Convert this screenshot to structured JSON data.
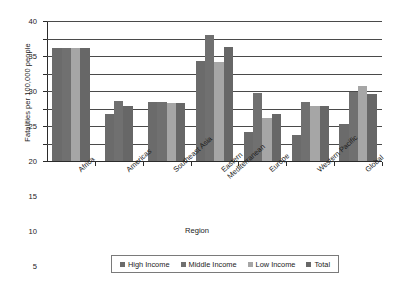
{
  "chart_data": {
    "type": "bar",
    "title": "",
    "xlabel": "Region",
    "ylabel": "Fatalities per 100,000 people",
    "ylim": [
      0,
      40
    ],
    "ytick_step": 5,
    "yticks": [
      "40",
      "35",
      "30",
      "25",
      "20",
      "15",
      "10",
      "5",
      "0"
    ],
    "grid": true,
    "legend_position": "bottom",
    "categories": [
      "Africa",
      "Americas",
      "Southeast Asia",
      "Eastern\nMediterranean",
      "Europe",
      "Western Pacific",
      "Global"
    ],
    "series": [
      {
        "name": "High Income",
        "color": "#6b6b6b",
        "values": [
          32.2,
          13.5,
          16.9,
          28.5,
          8.2,
          7.3,
          10.5
        ]
      },
      {
        "name": "Middle Income",
        "color": "#707070",
        "values": [
          32.3,
          17.2,
          16.8,
          36.0,
          19.5,
          16.9,
          19.6
        ]
      },
      {
        "name": "Low Income",
        "color": "#a6a6a6",
        "values": [
          32.3,
          null,
          16.6,
          28.4,
          12.4,
          15.6,
          21.5
        ]
      },
      {
        "name": "Total",
        "color": "#676767",
        "values": [
          32.2,
          15.8,
          16.6,
          32.6,
          13.5,
          15.7,
          19.2
        ]
      }
    ]
  },
  "legend": {
    "items": [
      {
        "label": "High Income"
      },
      {
        "label": "Middle Income"
      },
      {
        "label": "Low Income"
      },
      {
        "label": "Total"
      }
    ]
  },
  "axes": {
    "x_title": "Region",
    "y_title": "Fatalities per 100,000 people"
  }
}
